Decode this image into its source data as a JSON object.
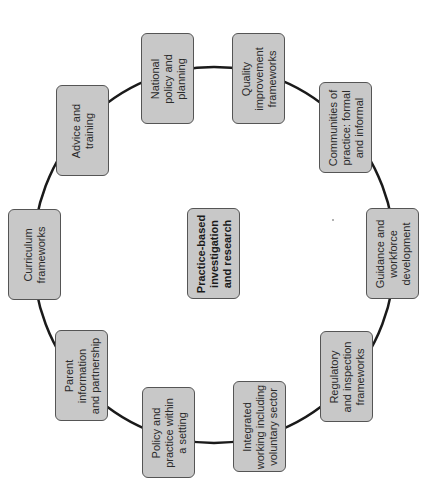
{
  "diagram": {
    "type": "cycle",
    "orientation": "rotated-90-ccw",
    "colors": {
      "node_fill": "#c8c8c8",
      "node_border": "#555555",
      "connector": "#1a1a1a",
      "text": "#2a2a2a",
      "background": "#ffffff"
    },
    "center": {
      "label": "Practice-based\ninvestigation\nand research"
    },
    "nodes": [
      {
        "id": "national",
        "label": "National\npolicy and\nplanning"
      },
      {
        "id": "quality",
        "label": "Quality\nimprovement\nframeworks"
      },
      {
        "id": "communities",
        "label": "Communities of\npractice: formal\nand informal"
      },
      {
        "id": "guidance",
        "label": "Guidance and\nworkforce\ndevelopment"
      },
      {
        "id": "regulatory",
        "label": "Regulatory\nand inspection\nframeworks"
      },
      {
        "id": "integrated",
        "label": "Integrated\nworking including\nvoluntary sector"
      },
      {
        "id": "policy",
        "label": "Policy and\npractice within\na setting"
      },
      {
        "id": "parent",
        "label": "Parent\ninformation\nand partnership"
      },
      {
        "id": "curriculum",
        "label": "Curriculum\nframeworks"
      },
      {
        "id": "advice",
        "label": "Advice and\ntraining"
      }
    ]
  }
}
